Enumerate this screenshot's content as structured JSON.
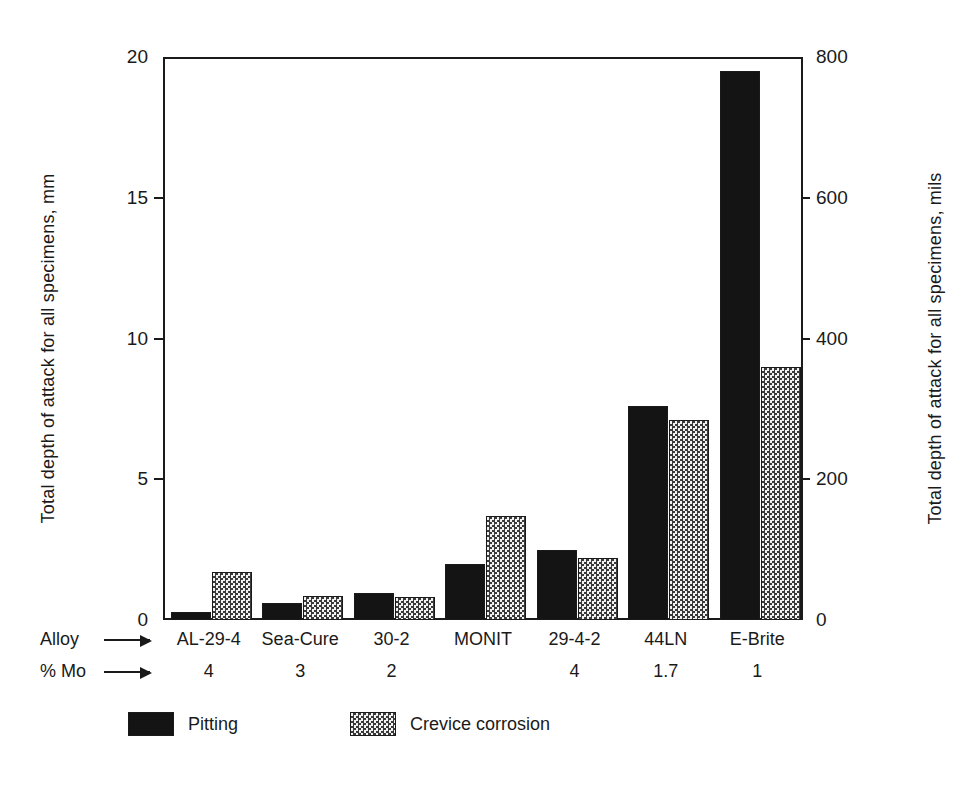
{
  "chart_data": {
    "type": "bar",
    "title": "",
    "categories": [
      "AL-29-4",
      "Sea-Cure",
      "30-2",
      "MONIT",
      "29-4-2",
      "44LN",
      "E-Brite"
    ],
    "series": [
      {
        "name": "Pitting",
        "values": [
          0.3,
          0.6,
          0.95,
          2.0,
          2.5,
          7.6,
          19.5
        ]
      },
      {
        "name": "Crevice corrosion",
        "values": [
          1.7,
          0.85,
          0.8,
          3.7,
          2.2,
          7.1,
          9.0
        ]
      }
    ],
    "xlabel": "Alloy",
    "ylabel": "Total depth of attack for all specimens, mm",
    "ylabel_secondary": "Total depth of attack for all specimens, mils",
    "ylim": [
      0,
      20
    ],
    "ylim_secondary": [
      0,
      800
    ],
    "yticks": [
      "0",
      "5",
      "10",
      "15",
      "20"
    ],
    "ytick_values": [
      0,
      5,
      10,
      15,
      20
    ],
    "yticks_secondary": [
      "0",
      "200",
      "400",
      "600",
      "800"
    ],
    "ytick_values_secondary": [
      0,
      200,
      400,
      600,
      800
    ],
    "grid": false,
    "legend_position": "bottom-left",
    "secondary_row_label": "% Mo",
    "secondary_row_values": [
      "4",
      "3",
      "2",
      "",
      "4",
      "1.7",
      "1"
    ]
  },
  "axes": {
    "left": {
      "title": "Total depth of attack for all specimens, mm",
      "ticks": [
        {
          "label": "20",
          "value": 20
        },
        {
          "label": "15",
          "value": 15
        },
        {
          "label": "10",
          "value": 10
        },
        {
          "label": "5",
          "value": 5
        },
        {
          "label": "0",
          "value": 0
        }
      ]
    },
    "right": {
      "title": "Total depth of attack for all specimens, mils",
      "ticks": [
        {
          "label": "800",
          "value": 800
        },
        {
          "label": "600",
          "value": 600
        },
        {
          "label": "400",
          "value": 400
        },
        {
          "label": "200",
          "value": 200
        },
        {
          "label": "0",
          "value": 0
        }
      ]
    }
  },
  "xaxis": {
    "alloy_caption": "Alloy",
    "mo_caption": "% Mo",
    "alloys": [
      "AL-29-4",
      "Sea-Cure",
      "30-2",
      "MONIT",
      "29-4-2",
      "44LN",
      "E-Brite"
    ],
    "mo": [
      "4",
      "3",
      "2",
      "",
      "4",
      "1.7",
      "1"
    ]
  },
  "legend": {
    "items": [
      {
        "label": "Pitting",
        "color": "#141414",
        "pattern": "solid"
      },
      {
        "label": "Crevice corrosion",
        "color": "#e8e8e8",
        "pattern": "checkered"
      }
    ]
  },
  "colors": {
    "pitting": "#141414",
    "crevice": "#e8e8e8",
    "axis": "#1a1a1a",
    "background": "#ffffff"
  }
}
